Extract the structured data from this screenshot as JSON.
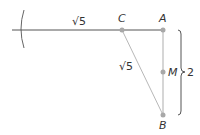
{
  "diagram": {
    "points": {
      "A": {
        "label": "A",
        "x": 163,
        "y": 30
      },
      "B": {
        "label": "B",
        "x": 163,
        "y": 115
      },
      "C": {
        "label": "C",
        "x": 122,
        "y": 30
      },
      "M": {
        "label": "M",
        "x": 163,
        "y": 72
      }
    },
    "labels": {
      "top_segment": "√5",
      "hypotenuse": "√5",
      "brace_length": "2"
    },
    "colors": {
      "line_dark": "#555555",
      "line_light": "#c0c0c0",
      "point": "#a8a8a8",
      "text": "#333333"
    }
  }
}
